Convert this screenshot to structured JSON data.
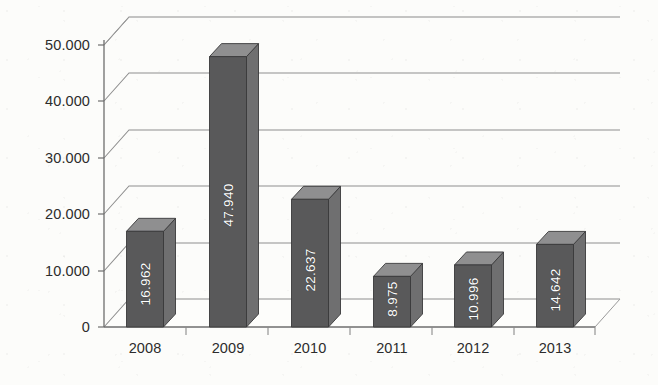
{
  "chart_data": {
    "type": "bar",
    "title": "",
    "subtitle": "",
    "xlabel": "",
    "ylabel": "",
    "categories": [
      "2008",
      "2009",
      "2010",
      "2011",
      "2012",
      "2013"
    ],
    "values": [
      16962,
      47940,
      22637,
      8975,
      10996,
      14642
    ],
    "value_labels": [
      "16.962",
      "47.940",
      "22.637",
      "8.975",
      "10.996",
      "14.642"
    ],
    "ytick_labels": [
      "50.000",
      "40.000",
      "30.000",
      "20.000",
      "10.000",
      "0"
    ],
    "ytick_values": [
      50000,
      40000,
      30000,
      20000,
      10000,
      0
    ],
    "ylim": [
      0,
      55000
    ],
    "grid": true,
    "grid_axis": "y",
    "legend": "none",
    "style_3d": true,
    "number_format": "period-thousands-separator",
    "series": [
      {
        "name": "",
        "values": [
          16962,
          47940,
          22637,
          8975,
          10996,
          14642
        ]
      }
    ],
    "colors": {
      "bar_front": "#59595a",
      "bar_top": "#8f8f90",
      "bar_side": "#6f6f70",
      "bar_outline": "#3a3a3b",
      "gridline": "#7d7d7d",
      "axis_line": "#6e6e6e",
      "floor": "#fbfbf9",
      "background": "#fcfcfa",
      "label_text": "#2c2c2c",
      "value_text": "#ffffff"
    }
  }
}
